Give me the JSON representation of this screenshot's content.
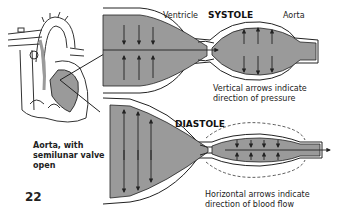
{
  "figure": {
    "systole": {
      "title": "SYSTOLE",
      "label_ventricle": "Ventricle",
      "label_aorta": "Aorta",
      "caption_line1": "Vertical arrows indicate",
      "caption_line2": "direction of pressure"
    },
    "diastole": {
      "title": "DIASTOLE",
      "caption_line1": "Horizontal arrows indicate",
      "caption_line2": "direction of blood flow"
    },
    "heart_label": {
      "line1": "Aorta, with",
      "line2": "semilunar valve",
      "line3": "open"
    },
    "page_number": "22"
  },
  "colors": {
    "fill": "#9a9a9a",
    "stroke": "#222222",
    "background": "#ffffff"
  }
}
